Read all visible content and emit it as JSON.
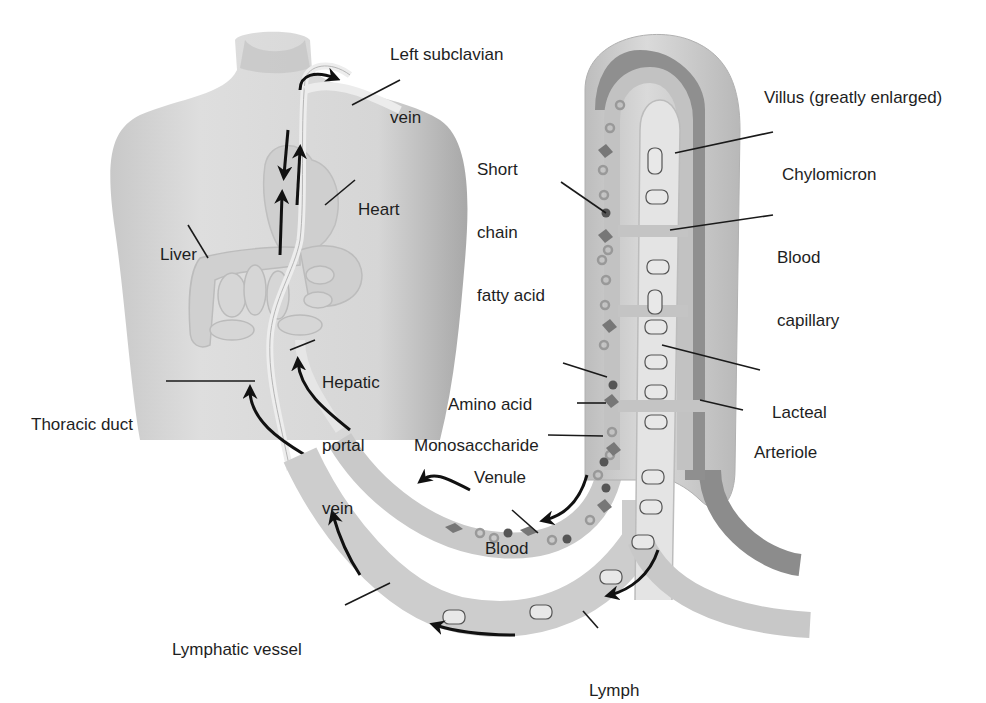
{
  "diagram": {
    "title": "Villus (greatly enlarged)",
    "colors": {
      "background": "#ffffff",
      "skin": "#dcdcdc",
      "villus_outer": "#d2d2d2",
      "capillary": "#c4c4c4",
      "lacteal": "#e4e4e4",
      "arteriole": "#8c8c8c",
      "text": "#1e1e1e",
      "arrow": "#111111"
    },
    "labels": {
      "left_subclavian_vein": [
        "Left subclavian",
        "vein"
      ],
      "heart": "Heart",
      "liver": "Liver",
      "thoracic_duct": "Thoracic duct",
      "hepatic_portal_vein": [
        "Hepatic",
        "portal",
        "vein"
      ],
      "short_chain_fatty_acid": [
        "Short",
        "chain",
        "fatty acid"
      ],
      "villus": "Villus (greatly enlarged)",
      "chylomicron": "Chylomicron",
      "blood_capillary": [
        "Blood",
        "capillary"
      ],
      "amino_acid": "Amino acid",
      "monosaccharide": "Monosaccharide",
      "venule": "Venule",
      "lacteal": "Lacteal",
      "arteriole": "Arteriole",
      "blood": "Blood",
      "lymphatic_vessel": "Lymphatic vessel",
      "lymph": "Lymph"
    }
  }
}
